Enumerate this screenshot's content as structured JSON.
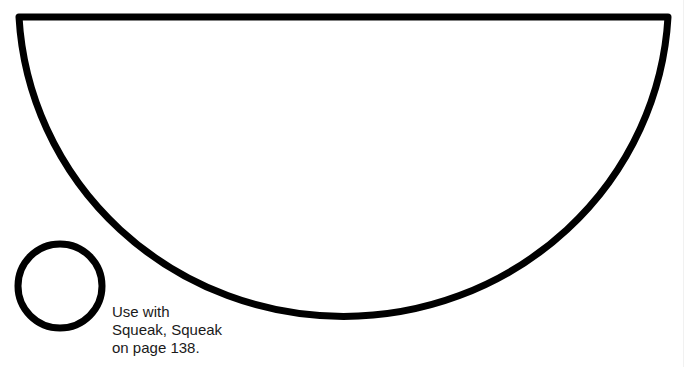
{
  "shapes": {
    "semicircle": {
      "name": "large-semicircle",
      "stroke": "#000000"
    },
    "circle": {
      "name": "small-circle",
      "stroke": "#000000"
    }
  },
  "caption": {
    "lines": [
      "Use with",
      "Squeak, Squeak",
      "on page 138."
    ]
  }
}
